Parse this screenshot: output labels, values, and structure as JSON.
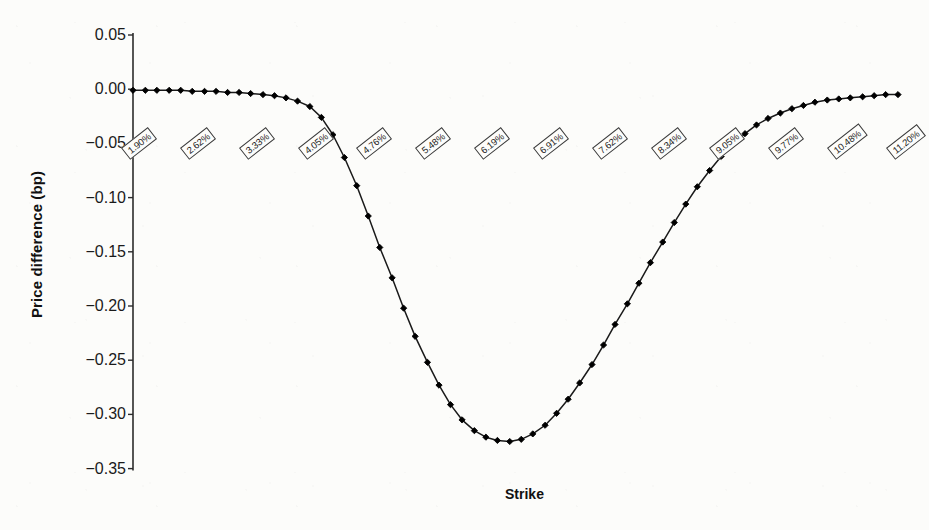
{
  "chart_data": {
    "type": "line",
    "title": "",
    "xlabel": "Strike",
    "ylabel": "Price difference (bp)",
    "ylim": [
      -0.35,
      0.05
    ],
    "yticks": [
      "0.05",
      "0.00",
      "-0.05",
      "-0.10",
      "-0.15",
      "-0.20",
      "-0.25",
      "-0.30",
      "-0.35"
    ],
    "ytick_values": [
      0.05,
      0.0,
      -0.05,
      -0.1,
      -0.15,
      -0.2,
      -0.25,
      -0.3,
      -0.35
    ],
    "xtick_labels": [
      "1.90%",
      "2.62%",
      "3.33%",
      "4.05%",
      "4.76%",
      "5.48%",
      "6.19%",
      "6.91%",
      "7.62%",
      "8.34%",
      "9.05%",
      "9.77%",
      "10.48%",
      "11.20%"
    ],
    "grid": false,
    "legend": false,
    "marker": "filled-diamond",
    "line_color": "#1a1a1a",
    "marker_color": "#000000",
    "series": [
      {
        "name": "Price difference",
        "x": [
          1.9,
          2.05,
          2.19,
          2.34,
          2.48,
          2.62,
          2.77,
          2.91,
          3.05,
          3.19,
          3.33,
          3.48,
          3.62,
          3.76,
          3.9,
          4.05,
          4.19,
          4.33,
          4.47,
          4.62,
          4.76,
          4.9,
          5.05,
          5.19,
          5.33,
          5.48,
          5.62,
          5.76,
          5.9,
          6.05,
          6.19,
          6.33,
          6.48,
          6.62,
          6.76,
          6.91,
          7.05,
          7.19,
          7.33,
          7.48,
          7.62,
          7.76,
          7.91,
          8.05,
          8.19,
          8.34,
          8.48,
          8.62,
          8.76,
          8.91,
          9.05,
          9.19,
          9.34,
          9.48,
          9.62,
          9.77,
          9.91,
          10.05,
          10.19,
          10.34,
          10.48,
          10.62,
          10.77,
          10.91,
          11.05,
          11.2
        ],
        "values": [
          -0.001,
          -0.001,
          -0.001,
          -0.001,
          -0.001,
          -0.002,
          -0.002,
          -0.002,
          -0.003,
          -0.003,
          -0.004,
          -0.005,
          -0.006,
          -0.008,
          -0.011,
          -0.016,
          -0.026,
          -0.042,
          -0.063,
          -0.089,
          -0.117,
          -0.146,
          -0.174,
          -0.202,
          -0.228,
          -0.252,
          -0.273,
          -0.291,
          -0.305,
          -0.315,
          -0.321,
          -0.324,
          -0.325,
          -0.323,
          -0.318,
          -0.31,
          -0.299,
          -0.286,
          -0.271,
          -0.254,
          -0.236,
          -0.217,
          -0.198,
          -0.179,
          -0.16,
          -0.141,
          -0.123,
          -0.106,
          -0.09,
          -0.075,
          -0.062,
          -0.051,
          -0.041,
          -0.033,
          -0.027,
          -0.022,
          -0.018,
          -0.015,
          -0.012,
          -0.01,
          -0.009,
          -0.008,
          -0.007,
          -0.006,
          -0.005,
          -0.005
        ]
      }
    ]
  }
}
